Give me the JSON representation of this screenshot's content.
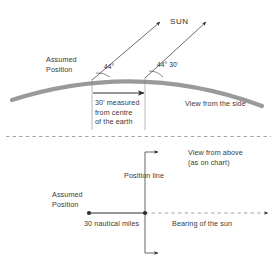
{
  "figure": {
    "colors": {
      "earth_curve": "#9a9a9a",
      "line": "#3f3f3f",
      "dashed": "#8d8d8d",
      "text": "#3a3a3a"
    }
  },
  "upper_view": {
    "sun_label": "SUN",
    "assumed_position_label": "Assumed\nPosition",
    "assumed_position_line1": "Assumed",
    "assumed_position_line2": "Position",
    "angle_left": "44°",
    "angle_right": "44° 30'",
    "measure_note_line1": "30' measured",
    "measure_note_line2": "from centre",
    "measure_note_line3": "of the earth",
    "view_caption": "View from the side"
  },
  "lower_view": {
    "view_caption_line1": "View from above",
    "view_caption_line2": "(as on chart)",
    "position_line_label": "Position line",
    "assumed_position_line1": "Assumed",
    "assumed_position_line2": "Position",
    "distance_label": "30 nautical miles",
    "bearing_label": "Bearing of the sun"
  }
}
